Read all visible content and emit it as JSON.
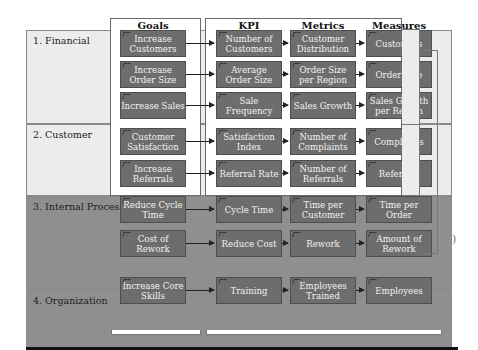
{
  "columns": {
    "goals": "Goals",
    "kpi": "KPI",
    "metrics": "Metrics",
    "measures": "Measures"
  },
  "perspectives": [
    {
      "label": "1. Financial",
      "rows": [
        {
          "goal": "Increase Customers",
          "kpi": "Number of Customers",
          "metric": "Customer Distribution",
          "measure": "Customers"
        },
        {
          "goal": "Increase Order Size",
          "kpi": "Average Order Size",
          "metric": "Order Size per Region",
          "measure": "Order Size"
        },
        {
          "goal": "Increase Sales",
          "kpi": "Sale Frequency",
          "metric": "Sales Growth",
          "measure": "Sales Growth per Region"
        }
      ]
    },
    {
      "label": "2. Customer",
      "rows": [
        {
          "goal": "Customer Satisfaction",
          "kpi": "Satisfaction Index",
          "metric": "Number of Complaints",
          "measure": "Complaints"
        },
        {
          "goal": "Increase Referrals",
          "kpi": "Referral Rate",
          "metric": "Number of Referrals",
          "measure": "Referrals"
        }
      ]
    },
    {
      "label": "3. Internal Processes",
      "rows": [
        {
          "goal": "Reduce Cycle Time",
          "kpi": "Cycle Time",
          "metric": "Time per Customer",
          "measure": "Time per Order"
        },
        {
          "goal": "Cost of Rework",
          "kpi": "Reduce Cost",
          "metric": "Rework",
          "measure": "Amount of Rework"
        }
      ]
    },
    {
      "label": "4. Organization",
      "rows": [
        {
          "goal": "Increase Core Skills",
          "kpi": "Training",
          "metric": "Employees Trained",
          "measure": "Employees"
        }
      ]
    }
  ]
}
